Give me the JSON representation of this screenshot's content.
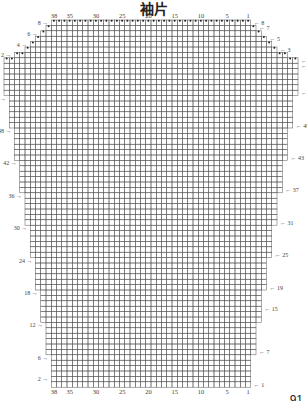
{
  "title": "袖片",
  "page_number": "91",
  "grid": {
    "cell_w": 5.25,
    "cell_h": 5.4,
    "center_x": 151,
    "top_y": 20,
    "line_color": "#555",
    "dot_color": "#222"
  },
  "col_labels": [
    "38",
    "35",
    "30",
    "25",
    "20",
    "15",
    "10",
    "5",
    "1"
  ],
  "col_label_positions": [
    38,
    35,
    30,
    25,
    20,
    15,
    10,
    5,
    1
  ],
  "cap_rows_right": [
    "8",
    "7",
    "5",
    "3",
    "1"
  ],
  "cap_rows_left": [
    "8",
    "6",
    "4",
    "2"
  ],
  "body_rows_right": [
    "60",
    "55",
    "49",
    "43",
    "37",
    "31",
    "25",
    "19",
    "15",
    "7",
    "1"
  ],
  "body_rows_left": [
    "54",
    "48",
    "42",
    "36",
    "30",
    "24",
    "18",
    "12",
    "6",
    "2"
  ],
  "rows_spec": {
    "cap": [
      {
        "row": 8,
        "cols": 38
      },
      {
        "row": 7,
        "cols": 40
      },
      {
        "row": 6,
        "cols": 42
      },
      {
        "row": 5,
        "cols": 44
      },
      {
        "row": 4,
        "cols": 46
      },
      {
        "row": 3,
        "cols": 48
      },
      {
        "row": 2,
        "cols": 52
      },
      {
        "row": 1,
        "cols": 56
      }
    ],
    "body_top_cols": 56,
    "body_bottom_cols": 38
  }
}
